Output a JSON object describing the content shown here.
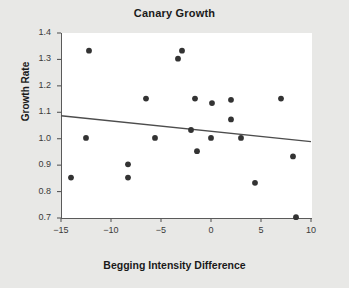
{
  "chart_data": {
    "type": "scatter",
    "title": "Canary Growth",
    "xlabel": "Begging Intensity Difference",
    "ylabel": "Growth Rate",
    "xlim": [
      -15,
      10
    ],
    "ylim": [
      0.7,
      1.4
    ],
    "xticks": [
      -15,
      -10,
      -5,
      0,
      5,
      10
    ],
    "xtick_labels": [
      "−15",
      "−10",
      "−5",
      "0",
      "5",
      "10"
    ],
    "yticks": [
      0.7,
      0.8,
      0.9,
      1.0,
      1.1,
      1.2,
      1.3,
      1.4
    ],
    "ytick_labels": [
      "0.7",
      "0.8",
      "0.9",
      "1.0",
      "1.1",
      "1.2",
      "1.3",
      "1.4"
    ],
    "grid": false,
    "legend": "none",
    "point_color": "#333333",
    "line_color": "#4d4d4d",
    "background_color": "#e8e8e6",
    "plot_background_color": "#ffffff",
    "points": [
      {
        "x": -14.0,
        "y": 0.853
      },
      {
        "x": -12.5,
        "y": 1.003
      },
      {
        "x": -12.2,
        "y": 1.333
      },
      {
        "x": -8.3,
        "y": 0.903
      },
      {
        "x": -8.3,
        "y": 0.853
      },
      {
        "x": -6.5,
        "y": 1.152
      },
      {
        "x": -5.6,
        "y": 1.003
      },
      {
        "x": -3.3,
        "y": 1.303
      },
      {
        "x": -2.9,
        "y": 1.333
      },
      {
        "x": -2.0,
        "y": 1.033
      },
      {
        "x": -1.6,
        "y": 1.152
      },
      {
        "x": -1.4,
        "y": 0.953
      },
      {
        "x": 0.0,
        "y": 1.003
      },
      {
        "x": 0.1,
        "y": 1.135
      },
      {
        "x": 2.0,
        "y": 1.147
      },
      {
        "x": 2.0,
        "y": 1.073
      },
      {
        "x": 3.0,
        "y": 1.003
      },
      {
        "x": 4.4,
        "y": 0.833
      },
      {
        "x": 7.0,
        "y": 1.152
      },
      {
        "x": 8.2,
        "y": 0.933
      },
      {
        "x": 8.5,
        "y": 0.703
      }
    ],
    "trend_line": {
      "x1": -15.0,
      "y1": 1.087,
      "x2": 10.0,
      "y2": 0.989
    }
  }
}
